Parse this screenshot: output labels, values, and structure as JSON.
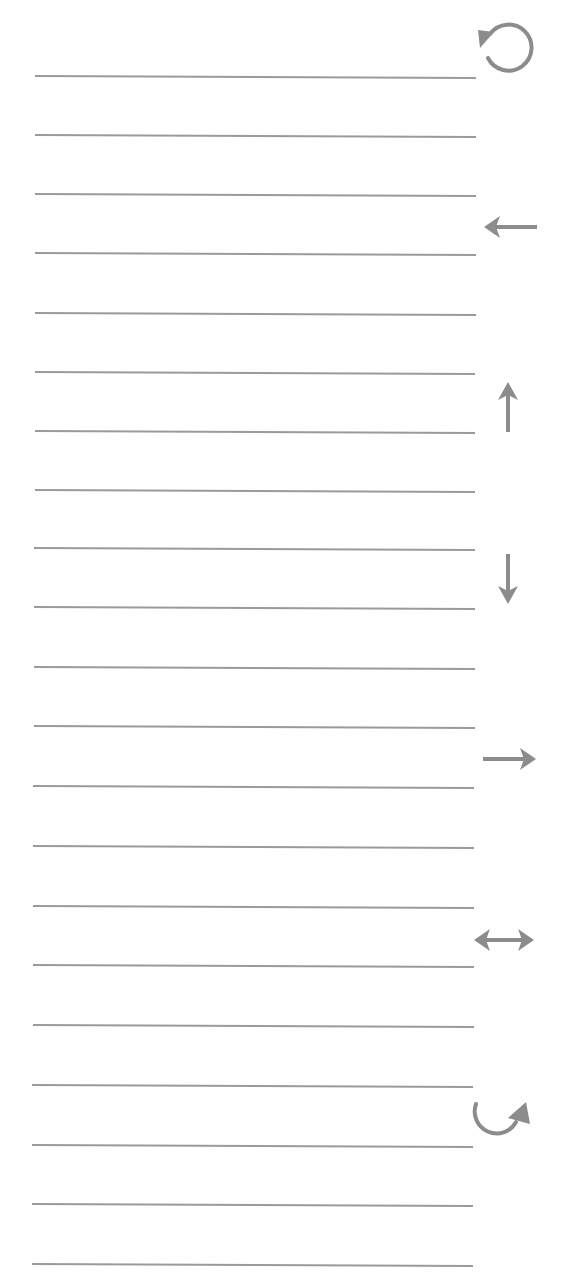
{
  "canvas": {
    "width": 568,
    "height": 1277,
    "background": "#ffffff"
  },
  "colors": {
    "line": "#9a9a9a",
    "icon": "#8c8c8c"
  },
  "lines": [
    {
      "y": 76
    },
    {
      "y": 135
    },
    {
      "y": 194
    },
    {
      "y": 253
    },
    {
      "y": 313
    },
    {
      "y": 372
    },
    {
      "y": 431
    },
    {
      "y": 490
    },
    {
      "y": 548
    },
    {
      "y": 607
    },
    {
      "y": 667
    },
    {
      "y": 726
    },
    {
      "y": 786
    },
    {
      "y": 846
    },
    {
      "y": 906
    },
    {
      "y": 965
    },
    {
      "y": 1025
    },
    {
      "y": 1085
    },
    {
      "y": 1145
    },
    {
      "y": 1204
    },
    {
      "y": 1264
    }
  ],
  "icons": [
    {
      "name": "rotate-counterclockwise-icon",
      "label": "Rotate counterclockwise"
    },
    {
      "name": "arrow-left-icon",
      "label": "Move left"
    },
    {
      "name": "arrow-up-icon",
      "label": "Move up"
    },
    {
      "name": "arrow-down-icon",
      "label": "Move down"
    },
    {
      "name": "arrow-right-icon",
      "label": "Move right"
    },
    {
      "name": "arrow-left-right-icon",
      "label": "Swap / horizontal"
    },
    {
      "name": "rotate-clockwise-icon",
      "label": "Rotate clockwise"
    }
  ]
}
